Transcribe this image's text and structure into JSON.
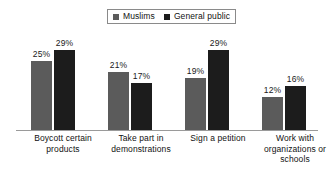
{
  "chart_data": {
    "type": "bar",
    "title": "",
    "xlabel": "",
    "ylabel": "",
    "ylim": [
      0,
      32
    ],
    "grid": false,
    "legend_position": "top-center",
    "categories": [
      "Boycott certain products",
      "Take part in demonstrations",
      "Sign a petition",
      "Work with organizations or schools"
    ],
    "category_lines": [
      [
        "Boycott certain",
        "products"
      ],
      [
        "Take part in",
        "demonstrations"
      ],
      [
        "Sign a petition"
      ],
      [
        "Work with",
        "organizations or",
        "schools"
      ]
    ],
    "series": [
      {
        "name": "Muslims",
        "color": "#5b5b5b",
        "values": [
          25,
          21,
          19,
          12
        ],
        "labels": [
          "25%",
          "21%",
          "19%",
          "12%"
        ]
      },
      {
        "name": "General public",
        "color": "#1c1c1c",
        "values": [
          29,
          17,
          29,
          16
        ],
        "labels": [
          "29%",
          "17%",
          "29%",
          "16%"
        ]
      }
    ]
  },
  "legend": {
    "items": [
      {
        "label": "Muslims",
        "color": "#5b5b5b"
      },
      {
        "label": "General public",
        "color": "#1c1c1c"
      }
    ]
  },
  "colors": {
    "muslims": "#5b5b5b",
    "general_public": "#1c1c1c",
    "axis": "#9a9a9a",
    "text": "#111111",
    "background": "#ffffff"
  }
}
